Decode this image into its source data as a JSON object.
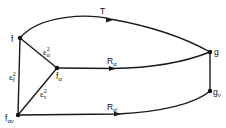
{
  "diagram": {
    "type": "graph",
    "nodes": [
      {
        "id": "f",
        "label": "f",
        "x": 20,
        "y": 38
      },
      {
        "id": "f_alpha",
        "label": "f",
        "sub": "α",
        "x": 57,
        "y": 68
      },
      {
        "id": "f_alpha_nu",
        "label": "f",
        "sub": "αν",
        "x": 18,
        "y": 115
      },
      {
        "id": "g",
        "label": "g",
        "x": 210,
        "y": 52
      },
      {
        "id": "g_nu",
        "label": "g",
        "sub": "ν",
        "x": 210,
        "y": 91
      }
    ],
    "edges": [
      {
        "from": "f",
        "to": "g",
        "label": "T",
        "curved": true,
        "arrow": true
      },
      {
        "from": "f_alpha",
        "to": "g",
        "label": "R",
        "label_sub": "α",
        "arrow": true
      },
      {
        "from": "f_alpha_nu",
        "to": "g_nu",
        "label": "R",
        "label_sub": "α'",
        "arrow": true
      },
      {
        "from": "f",
        "to": "f_alpha",
        "label": "ε",
        "label_sup": "2",
        "label_sub": "α"
      },
      {
        "from": "f",
        "to": "f_alpha_nu",
        "label": "ε",
        "label_sup": "2",
        "label_sub": "f"
      },
      {
        "from": "f_alpha",
        "to": "f_alpha_nu",
        "label": "ε",
        "label_sup": "2",
        "label_sub": "ν"
      },
      {
        "from": "g",
        "to": "g_nu",
        "label": ""
      }
    ]
  },
  "labels": {
    "f": {
      "main": "f"
    },
    "f_alpha": {
      "main": "f",
      "sub": "α"
    },
    "f_alpha_nu": {
      "main": "f",
      "sub": "αν"
    },
    "g": {
      "main": "g"
    },
    "g_nu": {
      "main": "g",
      "sub": "ν"
    },
    "T": {
      "main": "T"
    },
    "R_alpha": {
      "main": "R",
      "sub": "α"
    },
    "R_alpha_prime": {
      "main": "R",
      "sub": "α'"
    },
    "eps_alpha": {
      "main": "ε",
      "sup": "2",
      "sub": "α"
    },
    "eps_f": {
      "main": "ε",
      "sup": "2",
      "sub": "f"
    },
    "eps_nu": {
      "main": "ε",
      "sup": "2",
      "sub": "ν"
    }
  }
}
